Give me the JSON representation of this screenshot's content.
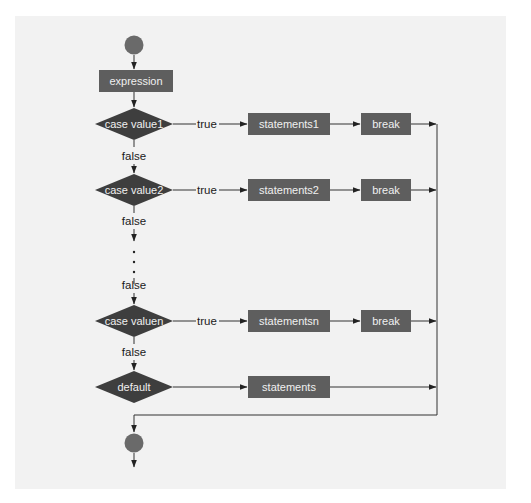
{
  "diagram": {
    "colors": {
      "background": "#f2f2f2",
      "box_fill": "#5e5e5e",
      "diamond_fill": "#3e3e3e",
      "circle_fill": "#6a6a6a",
      "line": "#333333",
      "box_text": "#f0f0f0",
      "label_text": "#1a1a1a"
    },
    "start_node": "start",
    "expression": "expression",
    "cases": [
      {
        "condition": "case value1",
        "true_label": "true",
        "statements": "statements1",
        "break": "break",
        "false_label": "false"
      },
      {
        "condition": "case value2",
        "true_label": "true",
        "statements": "statements2",
        "break": "break",
        "false_label": "false"
      },
      {
        "condition": "case valuen",
        "true_label": "true",
        "statements": "statementsn",
        "break": "break",
        "false_label": "false"
      }
    ],
    "ellipsis_false_label": "false",
    "default": {
      "condition": "default",
      "statements": "statements"
    },
    "end_node": "end"
  }
}
